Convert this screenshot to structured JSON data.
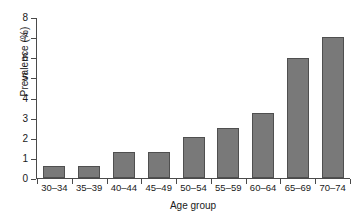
{
  "chart_data": {
    "type": "bar",
    "title": "",
    "xlabel": "Age group",
    "ylabel": "Prevalence (%)",
    "categories": [
      "30–34",
      "35–39",
      "40–44",
      "45–49",
      "50–54",
      "55–59",
      "60–64",
      "65–69",
      "70–74"
    ],
    "values": [
      0.6,
      0.6,
      1.3,
      1.3,
      2.05,
      2.5,
      3.25,
      6.0,
      7.05
    ],
    "ylim": [
      0,
      8
    ],
    "yticks": [
      "0",
      "1",
      "2",
      "3",
      "4",
      "5",
      "6",
      "7",
      "8"
    ],
    "ytick_values": [
      0,
      1,
      2,
      3,
      4,
      5,
      6,
      7,
      8
    ],
    "grid": false,
    "legend": false,
    "bar_color": "#797979",
    "bar_edge_color": "#4f4f4f",
    "axis_color": "#4a4a4a"
  }
}
